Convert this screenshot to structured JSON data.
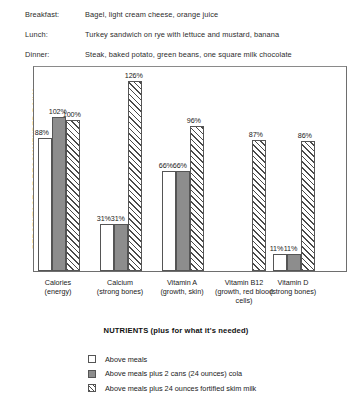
{
  "meals": {
    "rows": [
      {
        "label": "Breakfast:",
        "text": "Bagel, light cream cheese, orange juice"
      },
      {
        "label": "Lunch:",
        "text": "Turkey sandwich on rye with lettuce and mustard, banana"
      },
      {
        "label": "Dinner:",
        "text": "Steak, baked potato, green beans, one square milk chocolate"
      }
    ]
  },
  "chart_data": {
    "type": "bar",
    "title": "",
    "xlabel": "NUTRIENTS (plus for what it's needed)",
    "ylabel": "PERCENTAGE OF RECOMMENDED DAILY REQUIREMENT",
    "ylim": [
      0,
      135
    ],
    "grid": false,
    "legend_position": "bottom",
    "categories": [
      "Calories (energy)",
      "Calcium (strong bones)",
      "Vitamin A (growth, skin)",
      "Vitamin B12 (growth, red blood cells)",
      "Vitamin D (strong bones)"
    ],
    "category_lines": [
      [
        "Calories",
        "(energy)"
      ],
      [
        "Calcium",
        "(strong bones)"
      ],
      [
        "Vitamin A",
        "(growth, skin)"
      ],
      [
        "Vitamin B12",
        "(growth, red blood",
        "cells)"
      ],
      [
        "Vitamin D",
        "(strong bones)"
      ]
    ],
    "series": [
      {
        "name": "Above meals",
        "swatch": "empty",
        "values": [
          88,
          31,
          66,
          0,
          11
        ]
      },
      {
        "name": "Above meals plus 2 cans (24 ounces) cola",
        "swatch": "solid-gray",
        "values": [
          102,
          31,
          66,
          0,
          11
        ]
      },
      {
        "name": "Above meals plus 24 ounces fortified skim milk",
        "swatch": "hatched",
        "values": [
          100,
          126,
          96,
          87,
          86
        ]
      }
    ],
    "value_labels": [
      [
        "88%",
        "102%",
        "100%"
      ],
      [
        "31%",
        "31%",
        "126%"
      ],
      [
        "66%",
        "66%",
        "96%"
      ],
      [
        "",
        "",
        "87%"
      ],
      [
        "11%",
        "11%",
        "86%"
      ]
    ]
  },
  "legend": {
    "items": [
      {
        "swatch": "empty",
        "label": "Above meals"
      },
      {
        "swatch": "solid-gray",
        "label": "Above meals plus 2 cans (24 ounces) cola"
      },
      {
        "swatch": "hatched",
        "label": "Above meals plus 24 ounces fortified skim milk"
      }
    ]
  }
}
